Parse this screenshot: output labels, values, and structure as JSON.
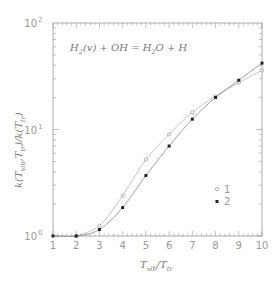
{
  "chart_data": {
    "type": "line",
    "title": "H2(v) + OH = H2O + H",
    "xlabel": "T_vib/T_tr",
    "ylabel": "k(T_vib,T_tr)/k(T_tr)",
    "xscale": "linear",
    "yscale": "log",
    "xlim": [
      1,
      10
    ],
    "ylim": [
      1,
      100
    ],
    "x_ticks": [
      "1",
      "2",
      "3",
      "4",
      "5",
      "6",
      "7",
      "8",
      "9",
      "10"
    ],
    "y_ticks": [
      "10^0",
      "10^1",
      "10^2"
    ],
    "grid": false,
    "legend_position": "lower right",
    "series": [
      {
        "name": "1",
        "marker": "open-circle",
        "x": [
          2,
          3,
          4,
          5,
          6,
          7,
          8,
          9,
          10
        ],
        "values": [
          1.0,
          1.25,
          2.4,
          5.2,
          9.0,
          14.5,
          20.5,
          27.5,
          36.0
        ]
      },
      {
        "name": "2",
        "marker": "filled-square",
        "x": [
          1,
          2,
          3,
          4,
          5,
          6,
          7,
          8,
          9,
          10
        ],
        "values": [
          1.0,
          1.0,
          1.15,
          1.85,
          3.7,
          7.0,
          12.5,
          20.0,
          29.0,
          42.0
        ]
      }
    ]
  },
  "labels": {
    "title_parts": [
      "H",
      "2",
      "(v) + OH = H",
      "2",
      "O + H"
    ],
    "xlabel_parts": [
      "T",
      "vib",
      "/T",
      "tr"
    ],
    "ylabel_parts": [
      "k(T",
      "vib",
      ",T",
      "tr",
      ")/k(T",
      "tr",
      ")"
    ],
    "y_tick_base": "10",
    "y_tick_exps": [
      "0",
      "1",
      "2"
    ],
    "legend": [
      "1",
      "2"
    ]
  },
  "colors": {
    "axis": "#999999",
    "series1": "#999999",
    "series2": "#222222",
    "text": "#777777"
  }
}
